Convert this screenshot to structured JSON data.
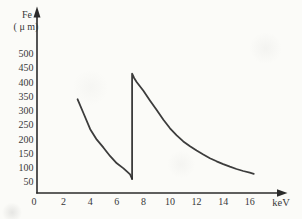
{
  "figure": {
    "background": "#fbfbf8",
    "ink": "#2b2b2b",
    "text_color": "#383838"
  },
  "chart_data": {
    "type": "line",
    "title": "",
    "xlabel": "keV",
    "ylabel_line1": "Fe",
    "ylabel_line2": "( μ m)",
    "xlim": [
      0,
      17.3
    ],
    "ylim": [
      0,
      530
    ],
    "x_ticks": [
      0,
      2,
      4,
      6,
      8,
      10,
      12,
      14,
      16
    ],
    "y_ticks": [
      50,
      100,
      150,
      200,
      250,
      300,
      350,
      400,
      450,
      500
    ],
    "grid": false,
    "legend": "none",
    "edge_keV": 7.1,
    "series": [
      {
        "name": "below-Fe-K-edge",
        "x": [
          3.05,
          3.5,
          4.0,
          4.5,
          5.0,
          5.5,
          6.0,
          6.5,
          7.0,
          7.15
        ],
        "y": [
          340,
          290,
          235,
          198,
          170,
          140,
          115,
          97,
          76,
          60
        ]
      },
      {
        "name": "above-Fe-K-edge",
        "x": [
          7.15,
          7.15,
          7.3,
          7.5,
          8.0,
          8.5,
          9.0,
          9.5,
          10.0,
          10.5,
          11.0,
          11.5,
          12.0,
          12.5,
          13.0,
          13.5,
          14.0,
          14.5,
          15.0,
          15.5,
          16.0,
          16.3
        ],
        "y": [
          60,
          430,
          415,
          400,
          370,
          335,
          302,
          268,
          238,
          213,
          192,
          175,
          160,
          146,
          133,
          122,
          112,
          103,
          95,
          88,
          82,
          78
        ]
      }
    ]
  }
}
